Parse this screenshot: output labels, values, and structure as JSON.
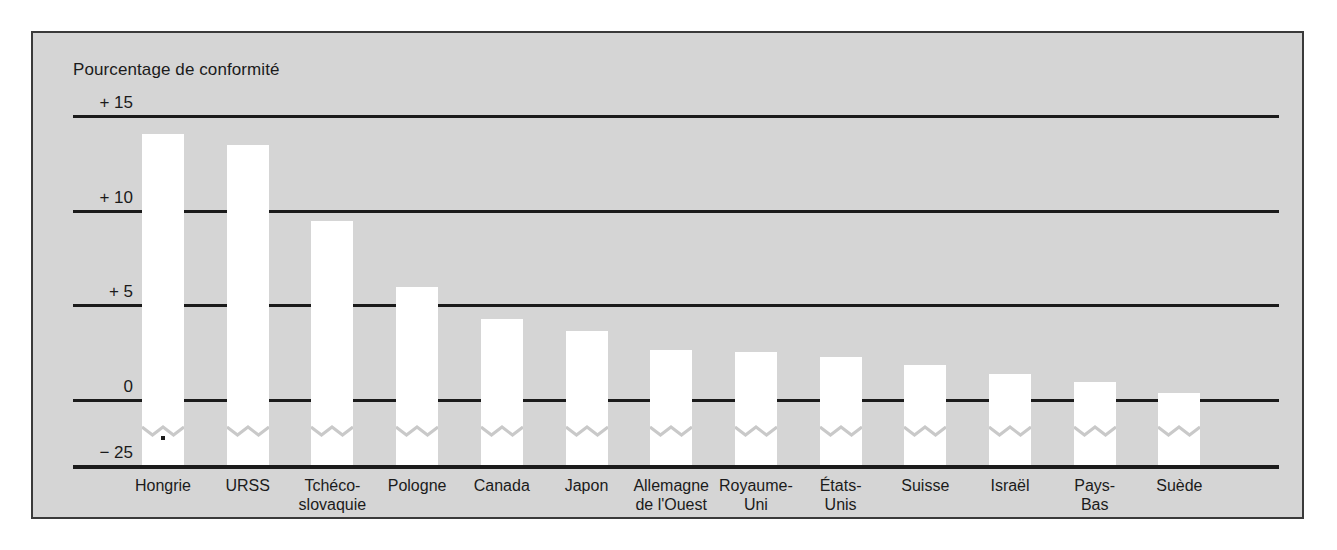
{
  "chart_data": {
    "type": "bar",
    "title": "Pourcentage de conformité",
    "xlabel": "",
    "ylabel": "",
    "ylim": [
      0,
      15
    ],
    "grid": true,
    "legend": null,
    "axis_break": "− 25",
    "ytick_labels": [
      "+ 15",
      "+ 10",
      "+ 5",
      "0",
      "− 25"
    ],
    "ytick_values": [
      15,
      10,
      5,
      0,
      -25
    ],
    "categories": [
      "Hongrie",
      "URSS",
      "Tchéco-\nslovaquie",
      "Pologne",
      "Canada",
      "Japon",
      "Allemagne\nde l'Ouest",
      "Royaume-\nUni",
      "États-\nUnis",
      "Suisse",
      "Israël",
      "Pays-\nBas",
      "Suède"
    ],
    "values": [
      14.0,
      13.4,
      9.4,
      5.9,
      4.2,
      3.6,
      2.6,
      2.5,
      2.2,
      1.8,
      1.3,
      0.9,
      0.3
    ],
    "bar_color": "#ffffff",
    "background_color": "#d5d5d5",
    "axis_color": "#1b1b1b"
  }
}
